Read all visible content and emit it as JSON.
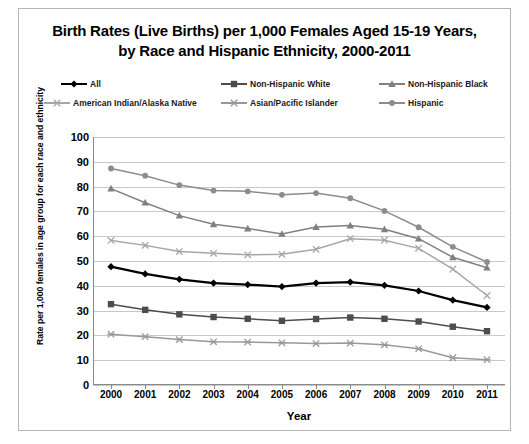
{
  "title": {
    "line1": "Birth Rates (Live Births) per 1,000 Females Aged 15-19 Years,",
    "line2": "by Race and Hispanic Ethnicity, 2000-2011"
  },
  "axes": {
    "x_title": "Year",
    "y_title": "Rate per 1,000 females in age group for each race and ethnicity"
  },
  "legend": [
    {
      "label": "All",
      "color": "#000000",
      "marker": "diamond"
    },
    {
      "label": "Non-Hispanic White",
      "color": "#4d4d4d",
      "marker": "square"
    },
    {
      "label": "Non-Hispanic Black",
      "color": "#808080",
      "marker": "triangle"
    },
    {
      "label": "American Indian/Alaska Native",
      "color": "#a6a6a6",
      "marker": "cross"
    },
    {
      "label": "Asian/Pacific Islander",
      "color": "#999999",
      "marker": "asterisk"
    },
    {
      "label": "Hispanic",
      "color": "#8c8c8c",
      "marker": "circle"
    }
  ],
  "chart_data": {
    "type": "line",
    "title": "Birth Rates (Live Births) per 1,000 Females Aged 15-19 Years, by Race and Hispanic Ethnicity, 2000-2011",
    "xlabel": "Year",
    "ylabel": "Rate per 1,000 females in age group for each race and ethnicity",
    "x": [
      2000,
      2001,
      2002,
      2003,
      2004,
      2005,
      2006,
      2007,
      2008,
      2009,
      2010,
      2011
    ],
    "categories": [
      "2000",
      "2001",
      "2002",
      "2003",
      "2004",
      "2005",
      "2006",
      "2007",
      "2008",
      "2009",
      "2010",
      "2011"
    ],
    "xlim": [
      2000,
      2011
    ],
    "ylim": [
      0,
      100
    ],
    "yticks": [
      0,
      10,
      20,
      30,
      40,
      50,
      60,
      70,
      80,
      90,
      100
    ],
    "grid": true,
    "legend_position": "top",
    "series": [
      {
        "name": "All",
        "color": "#000000",
        "marker": "diamond",
        "values": [
          47.7,
          44.8,
          42.6,
          41.1,
          40.5,
          39.7,
          41.1,
          41.5,
          40.2,
          37.9,
          34.2,
          31.3
        ]
      },
      {
        "name": "Non-Hispanic White",
        "color": "#4d4d4d",
        "marker": "square",
        "values": [
          32.6,
          30.3,
          28.5,
          27.4,
          26.7,
          25.9,
          26.6,
          27.2,
          26.7,
          25.6,
          23.5,
          21.7
        ]
      },
      {
        "name": "Non-Hispanic Black",
        "color": "#808080",
        "marker": "triangle",
        "values": [
          79.2,
          73.5,
          68.3,
          64.8,
          63.1,
          60.9,
          63.7,
          64.3,
          62.8,
          59.0,
          51.5,
          47.3
        ]
      },
      {
        "name": "American Indian/Alaska Native",
        "color": "#a6a6a6",
        "marker": "cross",
        "values": [
          58.3,
          56.3,
          53.8,
          53.1,
          52.5,
          52.7,
          54.7,
          59.0,
          58.4,
          55.1,
          46.7,
          36.1
        ]
      },
      {
        "name": "Asian/Pacific Islander",
        "color": "#999999",
        "marker": "asterisk",
        "values": [
          20.5,
          19.5,
          18.3,
          17.4,
          17.3,
          17.0,
          16.7,
          16.9,
          16.2,
          14.6,
          11.0,
          10.2
        ]
      },
      {
        "name": "Hispanic",
        "color": "#8c8c8c",
        "marker": "circle",
        "values": [
          87.3,
          84.4,
          80.6,
          78.4,
          78.1,
          76.7,
          77.4,
          75.3,
          70.2,
          63.6,
          55.7,
          49.6
        ]
      }
    ]
  }
}
